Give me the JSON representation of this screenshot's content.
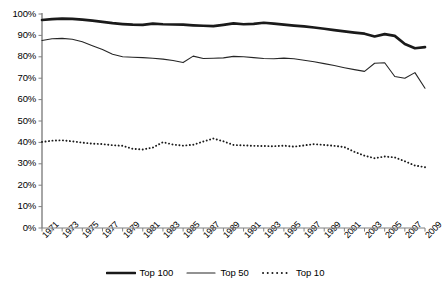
{
  "chart_data": {
    "type": "line",
    "title": "",
    "xlabel": "",
    "ylabel": "",
    "ylim": [
      0,
      100
    ],
    "ytick_labels": [
      "100%",
      "90%",
      "80%",
      "70%",
      "60%",
      "50%",
      "40%",
      "30%",
      "20%",
      "10%",
      "0%"
    ],
    "ytick_values": [
      100,
      90,
      80,
      70,
      60,
      50,
      40,
      30,
      20,
      10,
      0
    ],
    "grid": false,
    "legend_position": "bottom",
    "x": [
      1971,
      1972,
      1973,
      1974,
      1975,
      1976,
      1977,
      1978,
      1979,
      1980,
      1981,
      1982,
      1983,
      1984,
      1985,
      1986,
      1987,
      1988,
      1989,
      1990,
      1991,
      1992,
      1993,
      1994,
      1995,
      1996,
      1997,
      1998,
      1999,
      2000,
      2001,
      2002,
      2003,
      2004,
      2005,
      2006,
      2007,
      2008,
      2009
    ],
    "xtick_labels": [
      "1971",
      "1973",
      "1975",
      "1977",
      "1979",
      "1981",
      "1983",
      "1985",
      "1987",
      "1989",
      "1991",
      "1993",
      "1995",
      "1997",
      "1999",
      "2001",
      "2003",
      "2005",
      "2007",
      "2009"
    ],
    "series": [
      {
        "name": "Top 100",
        "style": "thick-solid",
        "color": "#1a1a1a",
        "values": [
          97.2,
          97.6,
          97.8,
          97.7,
          97.4,
          96.9,
          96.3,
          95.7,
          95.3,
          95.0,
          94.9,
          95.5,
          95.2,
          95.1,
          95.0,
          94.7,
          94.5,
          94.3,
          94.9,
          95.6,
          95.2,
          95.4,
          95.9,
          95.5,
          95.0,
          94.6,
          94.2,
          93.7,
          93.1,
          92.5,
          91.9,
          91.3,
          90.8,
          89.5,
          90.6,
          89.8,
          86.0,
          84.0,
          84.5
        ]
      },
      {
        "name": "Top 50",
        "style": "thin-solid",
        "color": "#262626",
        "values": [
          87.6,
          88.4,
          88.6,
          88.2,
          87.0,
          85.2,
          83.4,
          81.2,
          80.0,
          79.8,
          79.6,
          79.3,
          78.9,
          78.3,
          77.3,
          80.3,
          79.2,
          79.3,
          79.5,
          80.2,
          80.0,
          79.6,
          79.2,
          79.1,
          79.4,
          79.1,
          78.4,
          77.7,
          76.8,
          75.9,
          74.9,
          74.0,
          73.2,
          77.0,
          77.2,
          70.8,
          70.0,
          72.6,
          65.3
        ]
      },
      {
        "name": "Top 10",
        "style": "dotted",
        "color": "#1a1a1a",
        "values": [
          40.2,
          40.8,
          41.0,
          40.5,
          39.9,
          39.4,
          39.2,
          38.7,
          38.4,
          37.0,
          36.7,
          37.6,
          40.1,
          39.0,
          38.5,
          38.9,
          40.4,
          41.8,
          40.5,
          38.8,
          38.6,
          38.4,
          38.3,
          38.2,
          38.5,
          38.0,
          38.6,
          39.2,
          38.8,
          38.4,
          37.8,
          35.6,
          33.8,
          32.6,
          33.4,
          33.0,
          31.2,
          29.2,
          28.4
        ]
      }
    ]
  },
  "legend": {
    "items": [
      {
        "label": "Top 100"
      },
      {
        "label": "Top 50"
      },
      {
        "label": "Top 10"
      }
    ]
  }
}
